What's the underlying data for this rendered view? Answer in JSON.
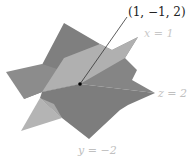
{
  "figure": {
    "point_label": "(1, −1, 2)",
    "planes": [
      {
        "label": "x = 1",
        "color": "#b4b4b4"
      },
      {
        "label": "z = 2",
        "color": "#8a8a8a"
      },
      {
        "label": "y = −2",
        "color": "#7d7d7d"
      }
    ],
    "point": {
      "x": 1,
      "y": -1,
      "z": 2,
      "color": "#000000"
    },
    "label_color": "#c2c2c2",
    "point_label_color": "#222222"
  }
}
